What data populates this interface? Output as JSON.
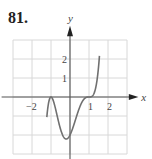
{
  "problem": {
    "number": "81."
  },
  "chart_data": {
    "type": "line",
    "title": "",
    "xlabel": "x",
    "ylabel": "y",
    "xlim": [
      -3,
      3
    ],
    "ylim": [
      -3,
      3
    ],
    "grid": true,
    "x_tick_labels": [
      {
        "value": -2,
        "label": "−2"
      },
      {
        "value": 1,
        "label": "1"
      },
      {
        "value": 2,
        "label": "2"
      }
    ],
    "y_tick_labels": [
      {
        "value": 1,
        "label": "1"
      },
      {
        "value": 2,
        "label": "2"
      }
    ],
    "series": [
      {
        "name": "f(x)",
        "description": "polynomial touching x-axis at -1, local minimum near (-0.1,-2), flat inflection crossing at 1",
        "x": [
          -1.2,
          -1.1,
          -1.0,
          -0.9,
          -0.75,
          -0.5,
          -0.25,
          0.0,
          0.25,
          0.5,
          0.75,
          0.9,
          1.0,
          1.1,
          1.25,
          1.4,
          1.55
        ],
        "y": [
          -2.7,
          -0.4,
          0.0,
          -0.03,
          -0.47,
          -1.42,
          -1.98,
          -2.0,
          -1.65,
          -0.56,
          -0.09,
          -0.01,
          0.0,
          0.01,
          0.16,
          0.74,
          2.45
        ]
      }
    ],
    "colors": {
      "grid": "#d8d8d8",
      "axis": "#555555",
      "curve": "#707070"
    }
  }
}
